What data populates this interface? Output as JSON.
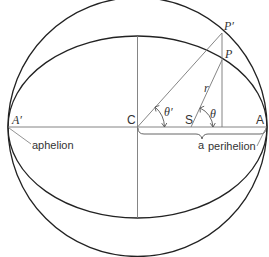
{
  "diagram": {
    "type": "kepler-eccentric-anomaly",
    "colors": {
      "background": "#ffffff",
      "curve": "#222222",
      "line": "#666666",
      "text": "#333333"
    },
    "labels": {
      "A_prime": "A′",
      "C": "C",
      "S": "S",
      "A": "A",
      "P_prime": "P′",
      "P": "P",
      "r": "r",
      "theta": "θ",
      "theta_prime": "θ′",
      "a": "a",
      "aphelion": "aphelion",
      "perihelion": "perihelion"
    },
    "shapes": {
      "auxiliary_circle": {
        "cx": 137.5,
        "cy": 127,
        "r": 129.5
      },
      "orbit_ellipse": {
        "cx": 137.5,
        "cy": 127,
        "rx": 129.5,
        "ry": 91
      },
      "focus_S": {
        "x": 191,
        "y": 127
      },
      "point_P_prime": {
        "x": 222,
        "y": 33
      },
      "point_P": {
        "x": 222,
        "y": 60
      }
    }
  }
}
